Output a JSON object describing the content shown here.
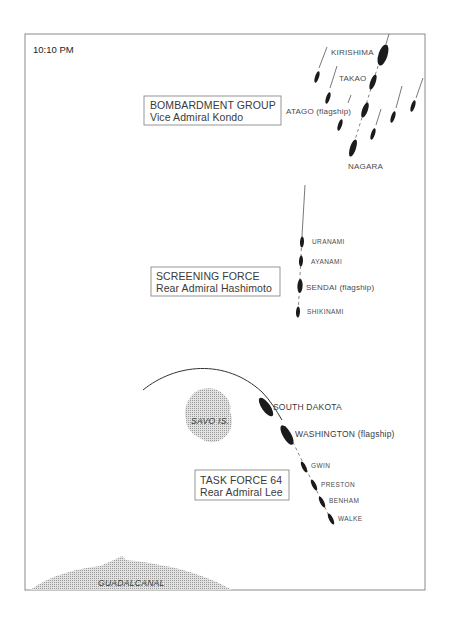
{
  "time": "10:10 PM",
  "colors": {
    "frame": "#8a8a8a",
    "ship": "#1b1b1b",
    "land_stipple": "#bdbdbd",
    "text": "#3a3a3a"
  },
  "groups": {
    "bombardment": {
      "title": "BOMBARDMENT GROUP",
      "commander": "Vice Admiral Kondo",
      "ships": {
        "kirishima": "KIRISHIMA",
        "takao": "TAKAO",
        "atago": "ATAGO (flagship)",
        "nagara": "NAGARA"
      }
    },
    "screening": {
      "title": "SCREENING FORCE",
      "commander": "Rear Admiral Hashimoto",
      "ships": {
        "uranami": "URANAMI",
        "ayanami": "AYANAMI",
        "sendai": "SENDAI (flagship)",
        "shikinami": "SHIKINAMI"
      }
    },
    "task_force": {
      "title": "TASK FORCE 64",
      "commander": "Rear Admiral Lee",
      "ships": {
        "south_dakota": "SOUTH DAKOTA",
        "washington": "WASHINGTON (flagship)",
        "gwin": "GWIN",
        "preston": "PRESTON",
        "benham": "BENHAM",
        "walke": "WALKE"
      }
    }
  },
  "islands": {
    "savo": "SAVO IS.",
    "guadalcanal": "GUADALCANAL"
  }
}
